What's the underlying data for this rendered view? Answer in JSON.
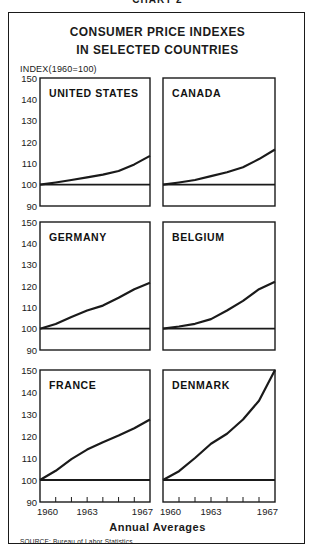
{
  "header": {
    "chart_label": "CHART 2",
    "title_line1": "CONSUMER PRICE INDEXES",
    "title_line2": "IN SELECTED COUNTRIES",
    "y_axis_label": "INDEX(1960=100)",
    "x_axis_label": "Annual Averages",
    "source": "SOURCE:  Bureau of Labor Statistics"
  },
  "chart_data": {
    "type": "line",
    "xlabel": "Annual Averages",
    "ylabel": "INDEX(1960=100)",
    "x": [
      1960,
      1961,
      1962,
      1963,
      1964,
      1965,
      1966,
      1967
    ],
    "x_tick_labels": [
      "1960",
      "1963",
      "1967"
    ],
    "y_ticks": [
      90,
      100,
      110,
      120,
      130,
      140,
      150
    ],
    "ylim": [
      90,
      150
    ],
    "baseline": 100,
    "grid": false,
    "layout": "3x2 small multiples",
    "series": [
      {
        "name": "UNITED STATES",
        "values": [
          100,
          101,
          102.2,
          103.4,
          104.7,
          106.4,
          109.5,
          113.5
        ]
      },
      {
        "name": "CANADA",
        "values": [
          100,
          101,
          102.2,
          104,
          105.8,
          108.2,
          112,
          116.5
        ]
      },
      {
        "name": "GERMANY",
        "values": [
          100,
          102.2,
          105.5,
          108.5,
          110.8,
          114.5,
          118.5,
          121.5
        ]
      },
      {
        "name": "BELGIUM",
        "values": [
          100,
          101,
          102.3,
          104.5,
          108.5,
          113,
          118.5,
          122
        ]
      },
      {
        "name": "FRANCE",
        "values": [
          100,
          104.2,
          109.5,
          113.8,
          117.2,
          120.2,
          123.5,
          127.5
        ]
      },
      {
        "name": "DENMARK",
        "values": [
          100,
          104,
          110,
          116.5,
          121,
          127.5,
          136,
          150
        ]
      }
    ]
  },
  "colors": {
    "ink": "#1a1a1a",
    "background": "#ffffff"
  }
}
